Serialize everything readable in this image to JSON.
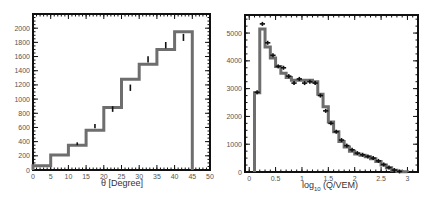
{
  "chart_data": [
    {
      "type": "bar",
      "title": "",
      "xlabel": "θ [Degree]",
      "ylabel": "",
      "xlim": [
        0,
        50
      ],
      "ylim": [
        0,
        2200
      ],
      "grid": false,
      "xticks": [
        "0",
        "5",
        "10",
        "15",
        "20",
        "25",
        "30",
        "35",
        "40",
        "45",
        "50"
      ],
      "yticks": [
        "0",
        "200",
        "400",
        "600",
        "800",
        "1000",
        "1200",
        "1400",
        "1600",
        "1800",
        "2000"
      ],
      "histogram": {
        "name": "simulation",
        "bin_edges": [
          0,
          5,
          10,
          15,
          20,
          25,
          30,
          35,
          40,
          45
        ],
        "values": [
          60,
          210,
          350,
          560,
          880,
          1280,
          1490,
          1700,
          1950
        ]
      },
      "points": {
        "name": "data",
        "x": [
          12.5,
          17.5,
          22.5,
          27.5,
          32.5,
          37.5,
          42.5
        ],
        "y": [
          370,
          620,
          860,
          1160,
          1560,
          1760,
          1870
        ],
        "err": [
          20,
          30,
          40,
          45,
          45,
          45,
          50
        ]
      }
    },
    {
      "type": "bar",
      "title": "",
      "xlabel": "log",
      "xlabel_sub": "10",
      "xlabel_rest": " (Q/VEM)",
      "ylabel": "",
      "xlim": [
        -0.08,
        3.2
      ],
      "ylim": [
        0,
        5650
      ],
      "grid": false,
      "xticks": [
        "0",
        "0.5",
        "1",
        "1.5",
        "2",
        "2.5",
        "3"
      ],
      "yticks": [
        "0",
        "1000",
        "2000",
        "3000",
        "4000",
        "5000"
      ],
      "histogram": {
        "name": "simulation",
        "bin_edges": [
          0.1,
          0.2,
          0.3,
          0.4,
          0.5,
          0.6,
          0.7,
          0.8,
          0.9,
          1.0,
          1.1,
          1.2,
          1.3,
          1.4,
          1.5,
          1.6,
          1.7,
          1.8,
          1.9,
          2.0,
          2.1,
          2.2,
          2.3,
          2.4,
          2.5,
          2.6,
          2.7,
          2.8,
          2.9,
          3.0
        ],
        "values": [
          2850,
          5150,
          4500,
          4100,
          3800,
          3550,
          3400,
          3300,
          3300,
          3300,
          3300,
          3250,
          2800,
          2350,
          1800,
          1450,
          1100,
          900,
          750,
          650,
          600,
          550,
          480,
          380,
          250,
          150,
          60,
          20,
          5
        ]
      },
      "points": {
        "name": "data",
        "x": [
          0.15,
          0.25,
          0.35,
          0.45,
          0.55,
          0.65,
          0.75,
          0.85,
          0.95,
          1.05,
          1.15,
          1.25,
          1.35,
          1.45,
          1.55,
          1.65,
          1.75,
          1.85,
          1.95,
          2.05,
          2.15,
          2.25,
          2.35,
          2.45,
          2.55,
          2.65,
          2.75,
          2.85
        ],
        "y": [
          2870,
          5330,
          4650,
          4200,
          3800,
          3750,
          3450,
          3200,
          3350,
          3200,
          3250,
          3200,
          2750,
          2200,
          1750,
          1450,
          1150,
          950,
          800,
          680,
          620,
          560,
          500,
          400,
          270,
          160,
          70,
          20
        ]
      }
    }
  ]
}
